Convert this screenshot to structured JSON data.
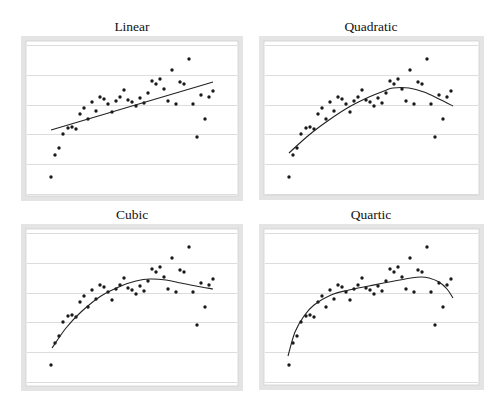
{
  "figure": {
    "panels": [
      {
        "id": "linear",
        "title": "Linear",
        "frame": {
          "x": 21,
          "y": 36,
          "w": 222,
          "h": 165
        },
        "title_pos": {
          "x": 132,
          "y": 31
        },
        "fit_curve": [
          [
            30,
            94
          ],
          [
            192,
            46
          ]
        ]
      },
      {
        "id": "quadratic",
        "title": "Quadratic",
        "frame": {
          "x": 259,
          "y": 36,
          "w": 225,
          "h": 164
        },
        "title_pos": {
          "x": 371,
          "y": 31
        },
        "fit_curve": [
          [
            30,
            117
          ],
          [
            50,
            99
          ],
          [
            70,
            84
          ],
          [
            90,
            71
          ],
          [
            110,
            61
          ],
          [
            125,
            55
          ],
          [
            134,
            52
          ],
          [
            150,
            52
          ],
          [
            165,
            56
          ],
          [
            180,
            63
          ],
          [
            194,
            70
          ]
        ]
      },
      {
        "id": "cubic",
        "title": "Cubic",
        "frame": {
          "x": 21,
          "y": 224,
          "w": 222,
          "h": 167
        },
        "title_pos": {
          "x": 132,
          "y": 219
        },
        "fit_curve": [
          [
            31,
            124
          ],
          [
            45,
            104
          ],
          [
            60,
            88
          ],
          [
            80,
            72
          ],
          [
            100,
            62
          ],
          [
            115,
            57
          ],
          [
            129,
            55
          ],
          [
            145,
            56
          ],
          [
            160,
            59
          ],
          [
            175,
            62
          ],
          [
            192,
            65
          ]
        ]
      },
      {
        "id": "quartic",
        "title": "Quartic",
        "frame": {
          "x": 259,
          "y": 224,
          "w": 225,
          "h": 166
        },
        "title_pos": {
          "x": 371,
          "y": 219
        },
        "fit_curve": [
          [
            29,
            132
          ],
          [
            36,
            108
          ],
          [
            45,
            92
          ],
          [
            55,
            81
          ],
          [
            72,
            71
          ],
          [
            90,
            66
          ],
          [
            110,
            62
          ],
          [
            130,
            58
          ],
          [
            152,
            54
          ],
          [
            162,
            53
          ],
          [
            170,
            54
          ],
          [
            180,
            58
          ],
          [
            188,
            65
          ],
          [
            194,
            74
          ]
        ]
      }
    ],
    "gridlines_rel_y": [
      9,
      39,
      69,
      98,
      128,
      158
    ],
    "points_rel": [
      [
        30,
        141
      ],
      [
        34,
        119
      ],
      [
        38,
        112
      ],
      [
        42,
        98
      ],
      [
        47,
        92
      ],
      [
        51,
        91
      ],
      [
        55,
        93
      ],
      [
        59,
        78
      ],
      [
        63,
        72
      ],
      [
        67,
        83
      ],
      [
        71,
        66
      ],
      [
        75,
        75
      ],
      [
        79,
        61
      ],
      [
        83,
        63
      ],
      [
        87,
        68
      ],
      [
        91,
        76
      ],
      [
        95,
        65
      ],
      [
        99,
        61
      ],
      [
        103,
        54
      ],
      [
        107,
        64
      ],
      [
        111,
        66
      ],
      [
        115,
        70
      ],
      [
        119,
        62
      ],
      [
        123,
        67
      ],
      [
        127,
        57
      ],
      [
        131,
        45
      ],
      [
        135,
        48
      ],
      [
        139,
        43
      ],
      [
        143,
        53
      ],
      [
        147,
        65
      ],
      [
        151,
        34
      ],
      [
        155,
        68
      ],
      [
        159,
        46
      ],
      [
        163,
        48
      ],
      [
        168,
        23
      ],
      [
        172,
        68
      ],
      [
        176,
        101
      ],
      [
        180,
        59
      ],
      [
        184,
        83
      ],
      [
        188,
        61
      ],
      [
        192,
        55
      ]
    ]
  },
  "chart_data": [
    {
      "type": "scatter",
      "title": "Linear",
      "xlabel": "",
      "ylabel": "",
      "grid": true,
      "legend": "none",
      "x": [
        1,
        2,
        3,
        4,
        5,
        6,
        7,
        8,
        9,
        10,
        11,
        12,
        13,
        14,
        15,
        16,
        17,
        18,
        19,
        20,
        21,
        22,
        23,
        24,
        25,
        26,
        27,
        28,
        29,
        30,
        31,
        32,
        33,
        34,
        35,
        36,
        37,
        38,
        39,
        40,
        41
      ],
      "series": [
        {
          "name": "observations",
          "values": [
            0.57,
            1.31,
            1.54,
            2.01,
            2.21,
            2.25,
            2.18,
            2.68,
            2.89,
            2.52,
            3.09,
            2.79,
            3.26,
            3.19,
            3.02,
            2.75,
            3.12,
            3.26,
            3.49,
            3.15,
            3.09,
            2.95,
            3.22,
            3.05,
            3.39,
            3.79,
            3.69,
            3.86,
            3.52,
            3.12,
            4.16,
            3.02,
            3.76,
            3.69,
            4.53,
            3.02,
            1.91,
            3.32,
            2.52,
            3.26,
            3.46
          ]
        },
        {
          "name": "linear fit",
          "type": "line",
          "x": [
            1,
            41
          ],
          "values": [
            2.15,
            3.76
          ]
        }
      ],
      "ylim": [
        -0.5,
        5.0
      ],
      "note": "No axis tick labels shown; y in gridline units (bottom gridline = 0, each gridline = 1)"
    },
    {
      "type": "scatter",
      "title": "Quadratic",
      "xlabel": "",
      "ylabel": "",
      "grid": true,
      "legend": "none",
      "x": [
        1,
        2,
        3,
        4,
        5,
        6,
        7,
        8,
        9,
        10,
        11,
        12,
        13,
        14,
        15,
        16,
        17,
        18,
        19,
        20,
        21,
        22,
        23,
        24,
        25,
        26,
        27,
        28,
        29,
        30,
        31,
        32,
        33,
        34,
        35,
        36,
        37,
        38,
        39,
        40,
        41
      ],
      "series": [
        {
          "name": "observations",
          "values": [
            0.57,
            1.31,
            1.54,
            2.01,
            2.21,
            2.25,
            2.18,
            2.68,
            2.89,
            2.52,
            3.09,
            2.79,
            3.26,
            3.19,
            3.02,
            2.75,
            3.12,
            3.26,
            3.49,
            3.15,
            3.09,
            2.95,
            3.22,
            3.05,
            3.39,
            3.79,
            3.69,
            3.86,
            3.52,
            3.12,
            4.16,
            3.02,
            3.76,
            3.69,
            4.53,
            3.02,
            1.91,
            3.32,
            2.52,
            3.26,
            3.46
          ]
        },
        {
          "name": "quadratic fit",
          "type": "line",
          "x": [
            1,
            6,
            11,
            16,
            21,
            25,
            27,
            31,
            35,
            39,
            42
          ],
          "values": [
            1.38,
            1.98,
            2.48,
            2.92,
            3.26,
            3.46,
            3.56,
            3.56,
            3.42,
            3.19,
            2.95
          ]
        }
      ],
      "ylim": [
        -0.5,
        5.0
      ]
    },
    {
      "type": "scatter",
      "title": "Cubic",
      "xlabel": "",
      "ylabel": "",
      "grid": true,
      "legend": "none",
      "x": [
        1,
        2,
        3,
        4,
        5,
        6,
        7,
        8,
        9,
        10,
        11,
        12,
        13,
        14,
        15,
        16,
        17,
        18,
        19,
        20,
        21,
        22,
        23,
        24,
        25,
        26,
        27,
        28,
        29,
        30,
        31,
        32,
        33,
        34,
        35,
        36,
        37,
        38,
        39,
        40,
        41
      ],
      "series": [
        {
          "name": "observations",
          "values": [
            0.57,
            1.31,
            1.54,
            2.01,
            2.21,
            2.25,
            2.18,
            2.68,
            2.89,
            2.52,
            3.09,
            2.79,
            3.26,
            3.19,
            3.02,
            2.75,
            3.12,
            3.26,
            3.49,
            3.15,
            3.09,
            2.95,
            3.22,
            3.05,
            3.39,
            3.79,
            3.69,
            3.86,
            3.52,
            3.12,
            4.16,
            3.02,
            3.76,
            3.69,
            4.53,
            3.02,
            1.91,
            3.32,
            2.52,
            3.26,
            3.46
          ]
        },
        {
          "name": "cubic fit",
          "type": "line",
          "x": [
            1,
            5,
            9,
            14,
            19,
            22,
            26,
            30,
            34,
            37,
            41
          ],
          "values": [
            1.17,
            1.85,
            2.38,
            2.92,
            3.26,
            3.42,
            3.49,
            3.46,
            3.36,
            3.26,
            3.09
          ]
        }
      ],
      "ylim": [
        -0.5,
        5.0
      ]
    },
    {
      "type": "scatter",
      "title": "Quartic",
      "xlabel": "",
      "ylabel": "",
      "grid": true,
      "legend": "none",
      "x": [
        1,
        2,
        3,
        4,
        5,
        6,
        7,
        8,
        9,
        10,
        11,
        12,
        13,
        14,
        15,
        16,
        17,
        18,
        19,
        20,
        21,
        22,
        23,
        24,
        25,
        26,
        27,
        28,
        29,
        30,
        31,
        32,
        33,
        34,
        35,
        36,
        37,
        38,
        39,
        40,
        41
      ],
      "series": [
        {
          "name": "observations",
          "values": [
            0.57,
            1.31,
            1.54,
            2.01,
            2.21,
            2.25,
            2.18,
            2.68,
            2.89,
            2.52,
            3.09,
            2.79,
            3.26,
            3.19,
            3.02,
            2.75,
            3.12,
            3.26,
            3.49,
            3.15,
            3.09,
            2.95,
            3.22,
            3.05,
            3.39,
            3.79,
            3.69,
            3.86,
            3.52,
            3.12,
            4.16,
            3.02,
            3.76,
            3.69,
            4.53,
            3.02,
            1.91,
            3.32,
            2.52,
            3.26,
            3.46
          ]
        },
        {
          "name": "quartic fit",
          "type": "line",
          "x": [
            1,
            3,
            5,
            8,
            11,
            16,
            21,
            26,
            31,
            34,
            36,
            38,
            40,
            42
          ],
          "values": [
            0.87,
            1.68,
            2.21,
            2.58,
            2.92,
            3.09,
            3.22,
            3.36,
            3.49,
            3.52,
            3.49,
            3.36,
            3.12,
            2.82
          ]
        }
      ],
      "ylim": [
        -0.5,
        5.0
      ]
    }
  ]
}
